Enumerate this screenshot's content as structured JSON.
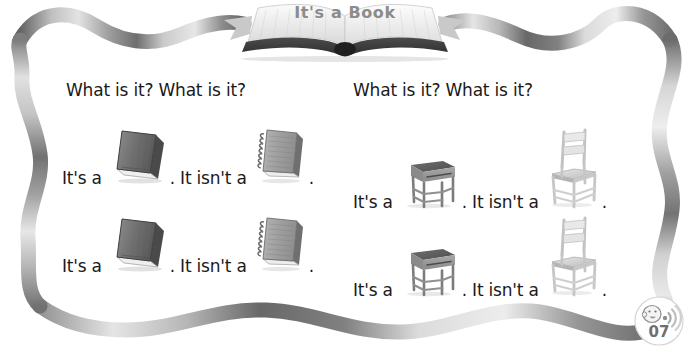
{
  "header": {
    "title": "It's a Book",
    "banner_icon": "open-book-icon"
  },
  "page": {
    "number": "07",
    "badge_icon": "listening-face-speaker-icon",
    "background_color": "#ffffff",
    "border_style": "wavy-rope-gray",
    "text_color": "#1a1a1a",
    "title_color": "#8c8c8c"
  },
  "columns": [
    {
      "name": "book-column",
      "question": "What is it? What is it?",
      "rows": [
        {
          "affirmative_text": "It's a",
          "affirmative_item": "book",
          "affirmative_icon": "book-icon",
          "period": ".",
          "negative_text": "It isn't a",
          "negative_item": "notebook",
          "negative_icon": "notebook-icon",
          "end_period": "."
        },
        {
          "affirmative_text": "It's a",
          "affirmative_item": "book",
          "affirmative_icon": "book-icon",
          "period": ".",
          "negative_text": "It isn't a",
          "negative_item": "notebook",
          "negative_icon": "notebook-icon",
          "end_period": "."
        }
      ]
    },
    {
      "name": "desk-column",
      "question": "What is it? What is it?",
      "rows": [
        {
          "affirmative_text": "It's a",
          "affirmative_item": "desk",
          "affirmative_icon": "desk-icon",
          "period": ".",
          "negative_text": "It isn't a",
          "negative_item": "chair",
          "negative_icon": "chair-icon",
          "end_period": "."
        },
        {
          "affirmative_text": "It's a",
          "affirmative_item": "desk",
          "affirmative_icon": "desk-icon",
          "period": ".",
          "negative_text": "It isn't a",
          "negative_item": "chair",
          "negative_icon": "chair-icon",
          "end_period": "."
        }
      ]
    }
  ]
}
